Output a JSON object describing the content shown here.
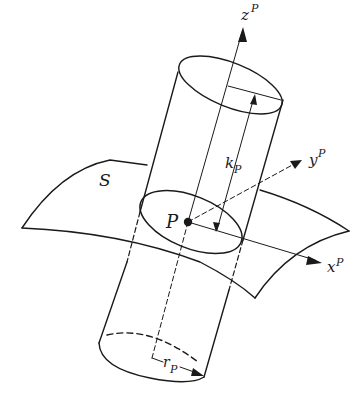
{
  "diagram": {
    "colors": {
      "ink": "#1a1a1a",
      "background": "#ffffff"
    },
    "labels": {
      "surface": "S",
      "point": "P",
      "z_axis": "z",
      "z_sup": "P",
      "y_axis": "y",
      "y_sup": "P",
      "x_axis": "x",
      "x_sup": "P",
      "height": "k",
      "height_sub": "P",
      "radius": "r",
      "radius_sub": "P"
    }
  }
}
